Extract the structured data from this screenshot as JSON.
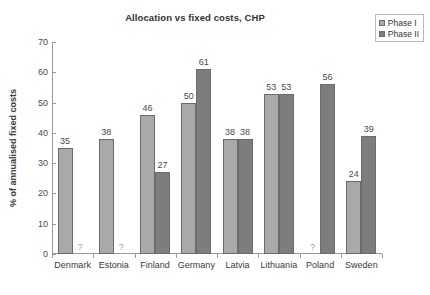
{
  "chart_data": {
    "type": "bar",
    "title": "Allocation vs fixed costs, CHP",
    "xlabel": "",
    "ylabel": "% of annualised fixed costs",
    "ylim": [
      0,
      70
    ],
    "ytick_step": 10,
    "yticks": [
      "70",
      "60",
      "50",
      "40",
      "30",
      "20",
      "10",
      "0"
    ],
    "grid": false,
    "legend_position": "top-right",
    "missing_marker": "?",
    "categories": [
      "Denmark",
      "Estonia",
      "Finland",
      "Germany",
      "Latvia",
      "Lithuania",
      "Poland",
      "Sweden"
    ],
    "series": [
      {
        "name": "Phase I",
        "color": "#a9a9a9",
        "values": [
          35,
          38,
          46,
          50,
          38,
          53,
          null,
          24
        ],
        "labels": [
          "35",
          "38",
          "46",
          "50",
          "38",
          "53",
          "?",
          "24"
        ]
      },
      {
        "name": "Phase II",
        "color": "#7d7d7d",
        "values": [
          null,
          null,
          27,
          61,
          38,
          53,
          56,
          39
        ],
        "labels": [
          "?",
          "?",
          "27",
          "61",
          "38",
          "53",
          "56",
          "39"
        ]
      }
    ]
  },
  "legend": {
    "items": [
      {
        "label": "Phase I",
        "color": "#a9a9a9"
      },
      {
        "label": "Phase II",
        "color": "#7d7d7d"
      }
    ]
  }
}
